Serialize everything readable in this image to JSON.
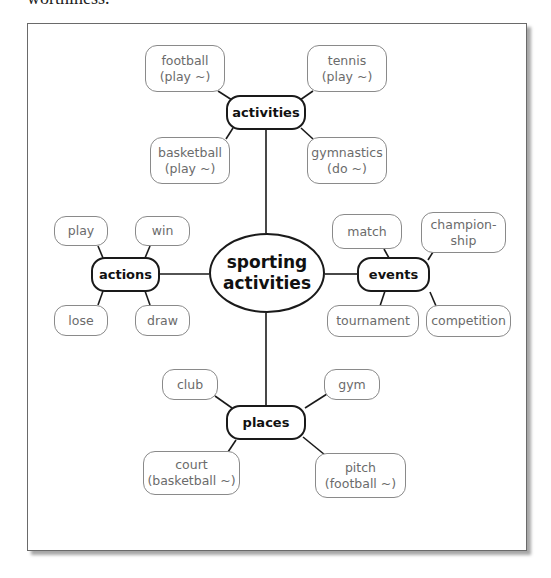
{
  "cut_off_text": "worthiness.",
  "diagram": {
    "title": "sporting activities",
    "center": {
      "line1": "sporting",
      "line2": "activities"
    },
    "branches": {
      "activities": {
        "label": "activities",
        "children": [
          {
            "line1": "football",
            "line2": "(play ~)"
          },
          {
            "line1": "tennis",
            "line2": "(play ~)"
          },
          {
            "line1": "basketball",
            "line2": "(play ~)"
          },
          {
            "line1": "gymnastics",
            "line2": "(do ~)"
          }
        ]
      },
      "actions": {
        "label": "actions",
        "children": [
          {
            "line1": "play"
          },
          {
            "line1": "win"
          },
          {
            "line1": "lose"
          },
          {
            "line1": "draw"
          }
        ]
      },
      "events": {
        "label": "events",
        "children": [
          {
            "line1": "match"
          },
          {
            "line1": "champion-",
            "line2": "ship"
          },
          {
            "line1": "tournament"
          },
          {
            "line1": "competition"
          }
        ]
      },
      "places": {
        "label": "places",
        "children": [
          {
            "line1": "club"
          },
          {
            "line1": "gym"
          },
          {
            "line1": "court",
            "line2": "(basketball ~)"
          },
          {
            "line1": "pitch",
            "line2": "(football ~)"
          }
        ]
      }
    }
  },
  "colors": {
    "hub_border": "#1a1a1a",
    "leaf_border": "#8a8a8a",
    "leaf_text": "#6b6b6b",
    "frame_border": "#6a6a6a"
  }
}
